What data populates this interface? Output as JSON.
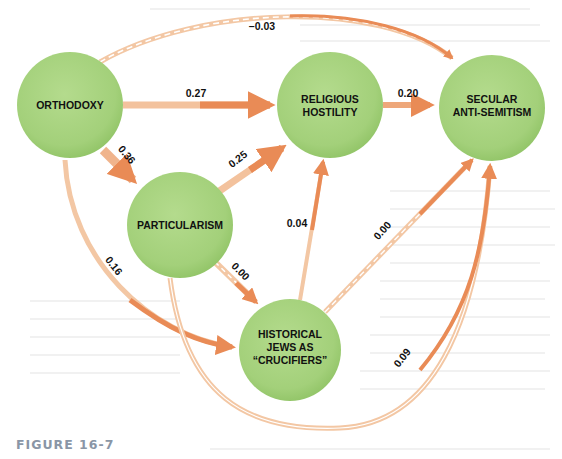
{
  "figure": {
    "label": "FIGURE 16-7"
  },
  "colors": {
    "node_fill": "#a3d07a",
    "node_fill_light": "#b7dc92",
    "node_edge": "#8fc165",
    "arrow_strong": "#e98b56",
    "arrow_light": "#f6cfae",
    "text": "#111111",
    "figure_label": "#8a96a6"
  },
  "nodes": [
    {
      "id": "orthodoxy",
      "lines": [
        "ORTHODOXY"
      ]
    },
    {
      "id": "religious_hostility",
      "lines": [
        "RELIGIOUS",
        "HOSTILITY"
      ]
    },
    {
      "id": "secular_antisemitism",
      "lines": [
        "SECULAR",
        "ANTI-SEMITISM"
      ]
    },
    {
      "id": "particularism",
      "lines": [
        "PARTICULARISM"
      ]
    },
    {
      "id": "historical_jews",
      "lines": [
        "HISTORICAL",
        "JEWS AS",
        "“CRUCIFIERS”"
      ]
    }
  ],
  "edges": [
    {
      "from": "orthodoxy",
      "to": "secular_antisemitism",
      "coef": "–0.03",
      "style": "dashed"
    },
    {
      "from": "orthodoxy",
      "to": "religious_hostility",
      "coef": "0.27",
      "style": "solid"
    },
    {
      "from": "religious_hostility",
      "to": "secular_antisemitism",
      "coef": "0.20",
      "style": "solid"
    },
    {
      "from": "orthodoxy",
      "to": "particularism",
      "coef": "0.36",
      "style": "solid"
    },
    {
      "from": "particularism",
      "to": "religious_hostility",
      "coef": "0.25",
      "style": "solid"
    },
    {
      "from": "orthodoxy",
      "to": "historical_jews",
      "coef": "0.16",
      "style": "solid"
    },
    {
      "from": "particularism",
      "to": "historical_jews",
      "coef": "0.00",
      "style": "dashed"
    },
    {
      "from": "historical_jews",
      "to": "religious_hostility",
      "coef": "0.04",
      "style": "solid"
    },
    {
      "from": "historical_jews",
      "to": "secular_antisemitism",
      "coef": "0.00",
      "style": "dashed"
    },
    {
      "from": "particularism",
      "to": "secular_antisemitism",
      "coef": "0.09",
      "style": "solid"
    }
  ]
}
